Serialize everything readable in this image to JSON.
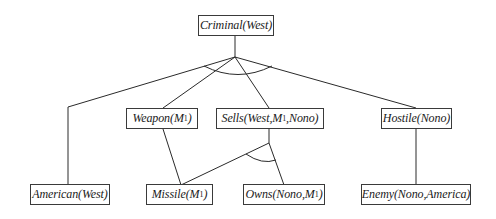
{
  "diagram": {
    "type": "and-or proof tree",
    "colors": {
      "stroke": "#2a2a2a",
      "box_border": "#3a3a3a",
      "text": "#1a1a1a",
      "background": "#ffffff"
    },
    "root": {
      "id": "criminal",
      "pred": "Criminal",
      "args_pre": "(West)",
      "sub": "",
      "args_post": ""
    },
    "level1": [
      {
        "id": "weapon",
        "pred": "Weapon",
        "args_pre": "(M",
        "sub": "1",
        "args_post": ")"
      },
      {
        "id": "sells",
        "pred": "Sells",
        "args_pre": "(West,M",
        "sub": "1",
        "args_post": ",Nono)"
      },
      {
        "id": "hostile",
        "pred": "Hostile",
        "args_pre": "(Nono)",
        "sub": "",
        "args_post": ""
      }
    ],
    "leaves": [
      {
        "id": "american",
        "pred": "American",
        "args_pre": "(West)",
        "sub": "",
        "args_post": ""
      },
      {
        "id": "missile",
        "pred": "Missile",
        "args_pre": "(M",
        "sub": "1",
        "args_post": ")"
      },
      {
        "id": "owns",
        "pred": "Owns",
        "args_pre": "(Nono,M",
        "sub": "1",
        "args_post": ")"
      },
      {
        "id": "enemy",
        "pred": "Enemy",
        "args_pre": "(Nono,America)",
        "sub": "",
        "args_post": ""
      }
    ],
    "edges": [
      {
        "from": "criminal",
        "to": "american",
        "and_group": "criminal-and"
      },
      {
        "from": "criminal",
        "to": "weapon",
        "and_group": "criminal-and"
      },
      {
        "from": "criminal",
        "to": "sells",
        "and_group": "criminal-and"
      },
      {
        "from": "criminal",
        "to": "hostile",
        "and_group": "criminal-and"
      },
      {
        "from": "weapon",
        "to": "missile"
      },
      {
        "from": "sells",
        "to": "missile",
        "and_group": "sells-and"
      },
      {
        "from": "sells",
        "to": "owns",
        "and_group": "sells-and"
      },
      {
        "from": "hostile",
        "to": "enemy"
      }
    ]
  }
}
